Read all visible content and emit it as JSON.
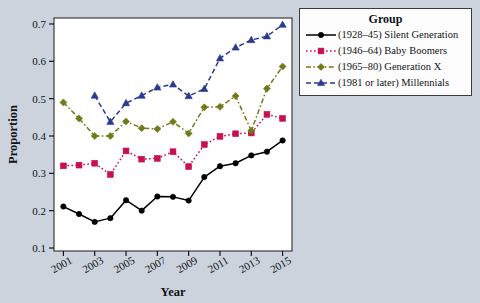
{
  "figure": {
    "background_color": "#ccd3dc",
    "plot_background_color": "#ffffff",
    "border_color": "#3c3c3c"
  },
  "legend": {
    "title": "Group",
    "position": "right-top",
    "entries": [
      {
        "label": "(1928–45) Silent Generation",
        "color": "#000000",
        "marker": "circle",
        "linestyle": "solid"
      },
      {
        "label": "(1946–64) Baby Boomers",
        "color": "#c8104a",
        "marker": "square",
        "linestyle": "dotted"
      },
      {
        "label": "(1965–80) Generation X",
        "color": "#6e7b16",
        "marker": "diamond",
        "linestyle": "dashdot"
      },
      {
        "label": "(1981 or later) Millennials",
        "color": "#2b3a8f",
        "marker": "triangle",
        "linestyle": "dashed"
      }
    ]
  },
  "chart_data": {
    "type": "line",
    "title": "",
    "xlabel": "Year",
    "ylabel": "Proportion",
    "xlim": [
      2000.4,
      2015.6
    ],
    "ylim": [
      0.092,
      0.716
    ],
    "grid": false,
    "x": [
      2001,
      2002,
      2003,
      2004,
      2005,
      2006,
      2007,
      2008,
      2009,
      2010,
      2011,
      2012,
      2013,
      2014,
      2015
    ],
    "xticks": [
      2001,
      2003,
      2005,
      2007,
      2009,
      2011,
      2013,
      2015
    ],
    "xticklabels": [
      "2001",
      "2003",
      "2005",
      "2007",
      "2009",
      "2011",
      "2013",
      "2015"
    ],
    "yticks": [
      0.1,
      0.2,
      0.3,
      0.4,
      0.5,
      0.6,
      0.7
    ],
    "yticklabels": [
      "0.1",
      "0.2",
      "0.3",
      "0.4",
      "0.5",
      "0.6",
      "0.7"
    ],
    "legend_title": "Group",
    "series": [
      {
        "name": "(1928–45) Silent Generation",
        "color": "#000000",
        "marker": "circle",
        "linestyle": "solid",
        "x": [
          2001,
          2002,
          2003,
          2004,
          2005,
          2006,
          2007,
          2008,
          2009,
          2010,
          2011,
          2012,
          2013,
          2014,
          2015
        ],
        "values": [
          0.211,
          0.191,
          0.17,
          0.18,
          0.228,
          0.2,
          0.238,
          0.237,
          0.227,
          0.29,
          0.319,
          0.327,
          0.348,
          0.358,
          0.388
        ]
      },
      {
        "name": "(1946–64) Baby Boomers",
        "color": "#c8104a",
        "marker": "square",
        "linestyle": "dotted",
        "x": [
          2001,
          2002,
          2003,
          2004,
          2005,
          2006,
          2007,
          2008,
          2009,
          2010,
          2011,
          2012,
          2013,
          2014,
          2015
        ],
        "values": [
          0.32,
          0.322,
          0.327,
          0.297,
          0.36,
          0.338,
          0.34,
          0.358,
          0.318,
          0.377,
          0.399,
          0.406,
          0.408,
          0.458,
          0.447
        ]
      },
      {
        "name": "(1965–80) Generation X",
        "color": "#6e7b16",
        "marker": "diamond",
        "linestyle": "dashdot",
        "x": [
          2001,
          2002,
          2003,
          2004,
          2005,
          2006,
          2007,
          2008,
          2009,
          2010,
          2011,
          2012,
          2013,
          2014,
          2015
        ],
        "values": [
          0.49,
          0.447,
          0.4,
          0.4,
          0.439,
          0.421,
          0.419,
          0.438,
          0.407,
          0.477,
          0.478,
          0.507,
          0.414,
          0.527,
          0.586
        ]
      },
      {
        "name": "(1981 or later) Millennials",
        "color": "#2b3a8f",
        "marker": "triangle",
        "linestyle": "dashed",
        "x": [
          2003,
          2004,
          2005,
          2006,
          2007,
          2008,
          2009,
          2010,
          2011,
          2012,
          2013,
          2014,
          2015
        ],
        "values": [
          0.508,
          0.438,
          0.488,
          0.508,
          0.53,
          0.538,
          0.507,
          0.526,
          0.608,
          0.637,
          0.657,
          0.667,
          0.698
        ]
      }
    ]
  }
}
